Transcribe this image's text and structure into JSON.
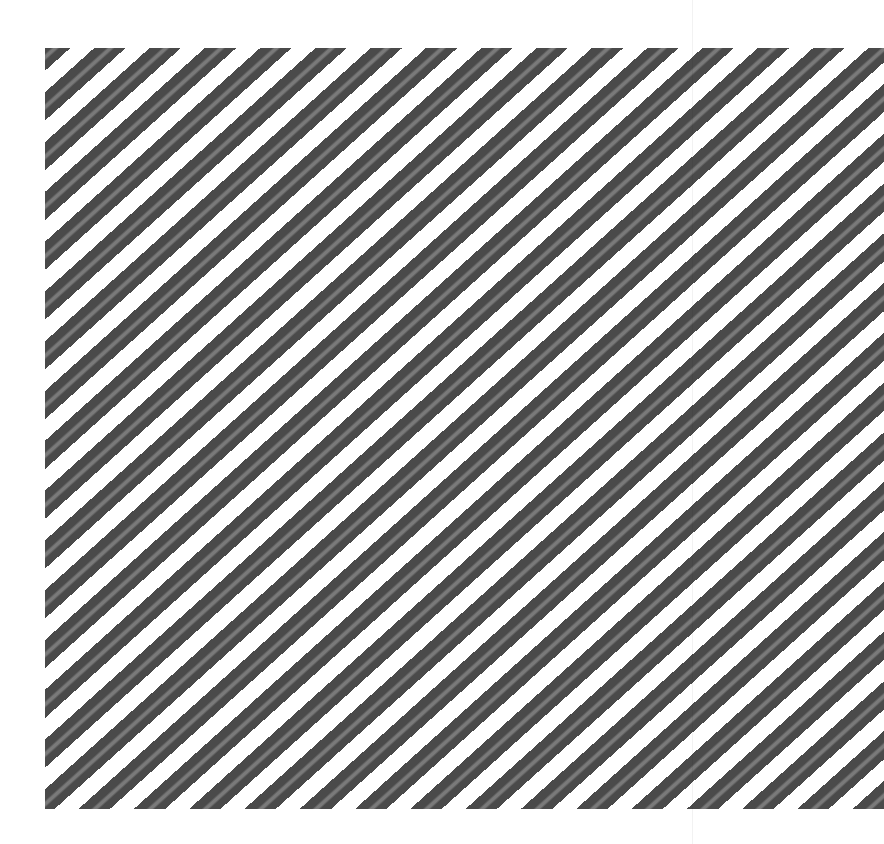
{
  "image": {
    "description": "Diagonal dark gray stripes with lighter center lines on white background",
    "colors": {
      "background": "#ffffff",
      "stripe_dark": "#4a4a4a",
      "stripe_light": "#7a7a7a"
    },
    "stripe_angle_deg": 42,
    "stripe_period_px": 37,
    "field": {
      "left": 45,
      "top": 48,
      "right": 884,
      "bottom": 809
    },
    "faint_vertical_lines_x": [
      692
    ]
  }
}
